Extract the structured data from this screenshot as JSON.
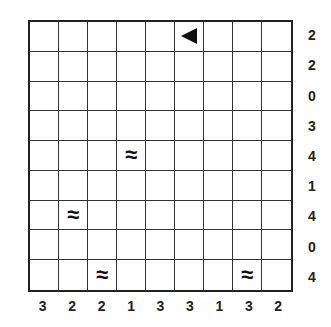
{
  "puzzle": {
    "type": "battleships",
    "size": 9,
    "row_clues": [
      "2",
      "2",
      "0",
      "3",
      "4",
      "1",
      "4",
      "0",
      "4"
    ],
    "col_clues": [
      "3",
      "2",
      "2",
      "1",
      "3",
      "3",
      "1",
      "3",
      "2"
    ],
    "given_cells": [
      {
        "row": 0,
        "col": 5,
        "kind": "ship-end-left",
        "glyph": "◀"
      },
      {
        "row": 4,
        "col": 3,
        "kind": "water",
        "glyph": "≈"
      },
      {
        "row": 6,
        "col": 1,
        "kind": "water",
        "glyph": "≈"
      },
      {
        "row": 8,
        "col": 2,
        "kind": "water",
        "glyph": "≈"
      },
      {
        "row": 8,
        "col": 7,
        "kind": "water",
        "glyph": "≈"
      }
    ]
  }
}
